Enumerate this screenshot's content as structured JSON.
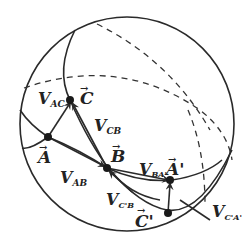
{
  "diagram": {
    "type": "spherical-geometry",
    "colors": {
      "stroke": "#2a2a2a",
      "background": "#ffffff"
    },
    "points": {
      "A": {
        "label": "A",
        "vector_arrow": "→"
      },
      "B": {
        "label": "B",
        "vector_arrow": "→"
      },
      "C": {
        "label": "C",
        "vector_arrow": "→"
      },
      "A_prime": {
        "label": "A'",
        "vector_arrow": "→"
      },
      "C_prime": {
        "label": "C'",
        "vector_arrow": "→"
      }
    },
    "vectors": {
      "V_AC": {
        "main": "V",
        "sub": "AC"
      },
      "V_CB": {
        "main": "V",
        "sub": "CB"
      },
      "V_AB": {
        "main": "V",
        "sub": "AB"
      },
      "V_BA": {
        "main": "V",
        "sub": "BA'"
      },
      "V_CB2": {
        "main": "V",
        "sub": "C'B"
      },
      "V_CA": {
        "main": "V",
        "sub": "C'A'"
      }
    }
  }
}
